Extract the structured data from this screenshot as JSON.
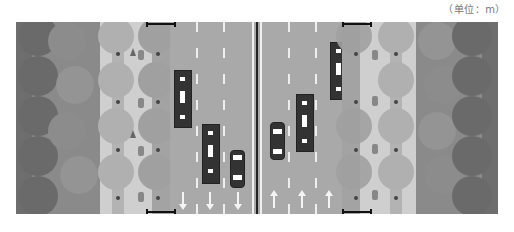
{
  "unit_label": "（单位：m）",
  "colors": {
    "background": "#ffffff",
    "road": "#a9a9a9",
    "lane_line": "#eeeeee",
    "vehicle": "#333333",
    "outer_green": "#6e6e6e",
    "tree_dark": "#7a7a7a",
    "tree_mid": "#9a9a9a",
    "tree_light": "#bdbdbd",
    "sidewalk": "#cfcfcf",
    "scale_bar": "#111111"
  },
  "layout": {
    "left_side": [
      "outer-green-belt",
      "tree-belt",
      "sidewalk-with-trees",
      "bike-path",
      "tree-strip"
    ],
    "carriageway": {
      "lanes_southbound": 3,
      "lanes_northbound": 3,
      "median": "double-solid-line"
    },
    "right_side": [
      "tree-strip",
      "bike-path",
      "sidewalk-with-trees",
      "tree-belt",
      "outer-green-belt"
    ]
  },
  "vehicles": [
    {
      "type": "bus",
      "direction": "down",
      "lane": 1
    },
    {
      "type": "bus",
      "direction": "down",
      "lane": 2
    },
    {
      "type": "car",
      "direction": "down",
      "lane": 3
    },
    {
      "type": "car",
      "direction": "up",
      "lane": 1
    },
    {
      "type": "bus",
      "direction": "up",
      "lane": 2
    },
    {
      "type": "bus",
      "direction": "up",
      "lane": 3
    }
  ],
  "lane_arrows": [
    "down",
    "down",
    "down",
    "up",
    "up",
    "up"
  ]
}
